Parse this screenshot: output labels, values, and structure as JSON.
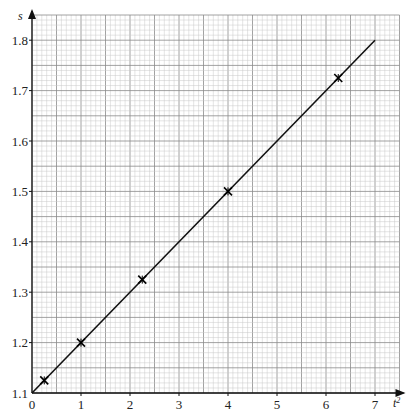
{
  "chart_data": {
    "type": "scatter",
    "title": "",
    "xlabel": "t²",
    "ylabel": "s",
    "xlim": [
      0,
      7.5
    ],
    "ylim": [
      1.1,
      1.85
    ],
    "x_ticks": [
      "0",
      "1",
      "2",
      "3",
      "4",
      "5",
      "6",
      "7"
    ],
    "y_ticks": [
      "1.1",
      "1.2",
      "1.3",
      "1.4",
      "1.5",
      "1.6",
      "1.7",
      "1.8"
    ],
    "grid": true,
    "grid_minor_x": 0.1,
    "grid_minor_y": 0.01,
    "legend": null,
    "series": [
      {
        "name": "measured points",
        "marker": "x-cross",
        "x": [
          0.25,
          1,
          2.25,
          4,
          6.25
        ],
        "y": [
          1.125,
          1.2,
          1.325,
          1.5,
          1.725
        ]
      },
      {
        "name": "best-fit line",
        "type": "line",
        "x": [
          0,
          7
        ],
        "y": [
          1.1,
          1.8
        ]
      }
    ],
    "colors": {
      "grid_minor": "#c8c8c8",
      "grid_major": "#8a8a8a",
      "axis": "#111111",
      "line": "#111111"
    }
  }
}
